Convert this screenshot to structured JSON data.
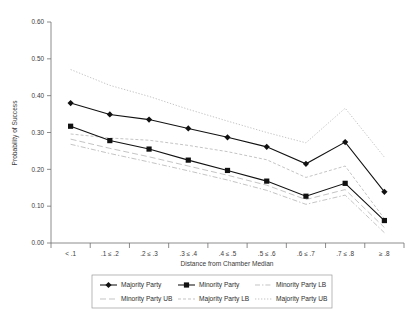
{
  "chart_data": {
    "type": "line",
    "title": "",
    "xlabel": "Distance from Chamber Median",
    "ylabel": "Probability of Success",
    "categories": [
      "< .1",
      ".1 ≤ .2",
      ".2 ≤ .3",
      ".3 ≤ .4",
      ".4 ≤ .5",
      ".5 ≤ .6",
      ".6 ≤ .7",
      ".7 ≤ .8",
      "≥ .8"
    ],
    "ylim": [
      0.0,
      0.6
    ],
    "ytick_labels": [
      "0.00",
      "0.10",
      "0.20",
      "0.30",
      "0.40",
      "0.50",
      "0.60"
    ],
    "ytick_values": [
      0.0,
      0.1,
      0.2,
      0.3,
      0.4,
      0.5,
      0.6
    ],
    "grid": false,
    "legend_position": "bottom",
    "series": [
      {
        "name": "Majority Party",
        "style": "solid-diamond",
        "values": [
          0.38,
          0.349,
          0.335,
          0.311,
          0.287,
          0.261,
          0.215,
          0.274,
          0.139
        ]
      },
      {
        "name": "Minority Party",
        "style": "solid-square",
        "values": [
          0.317,
          0.278,
          0.255,
          0.225,
          0.197,
          0.168,
          0.127,
          0.162,
          0.061
        ]
      },
      {
        "name": "Minority Party LB",
        "style": "dash-dot",
        "values": [
          0.268,
          0.243,
          0.22,
          0.196,
          0.171,
          0.143,
          0.105,
          0.13,
          0.028
        ]
      },
      {
        "name": "Minority Party UB",
        "style": "long-dash",
        "values": [
          0.282,
          0.257,
          0.234,
          0.209,
          0.184,
          0.157,
          0.118,
          0.145,
          0.042
        ]
      },
      {
        "name": "Majority Party LB",
        "style": "short-dash",
        "values": [
          0.296,
          0.285,
          0.279,
          0.265,
          0.248,
          0.226,
          0.178,
          0.209,
          0.066
        ]
      },
      {
        "name": "Majority Party UB",
        "style": "dotted",
        "values": [
          0.471,
          0.428,
          0.398,
          0.363,
          0.331,
          0.3,
          0.272,
          0.366,
          0.233
        ]
      }
    ]
  },
  "legend": {
    "entries": [
      {
        "label": "Majority Party"
      },
      {
        "label": "Minority Party"
      },
      {
        "label": "Minority Party LB"
      },
      {
        "label": "Minority Party UB"
      },
      {
        "label": "Majority Party LB"
      },
      {
        "label": "Majority Party UB"
      }
    ]
  }
}
